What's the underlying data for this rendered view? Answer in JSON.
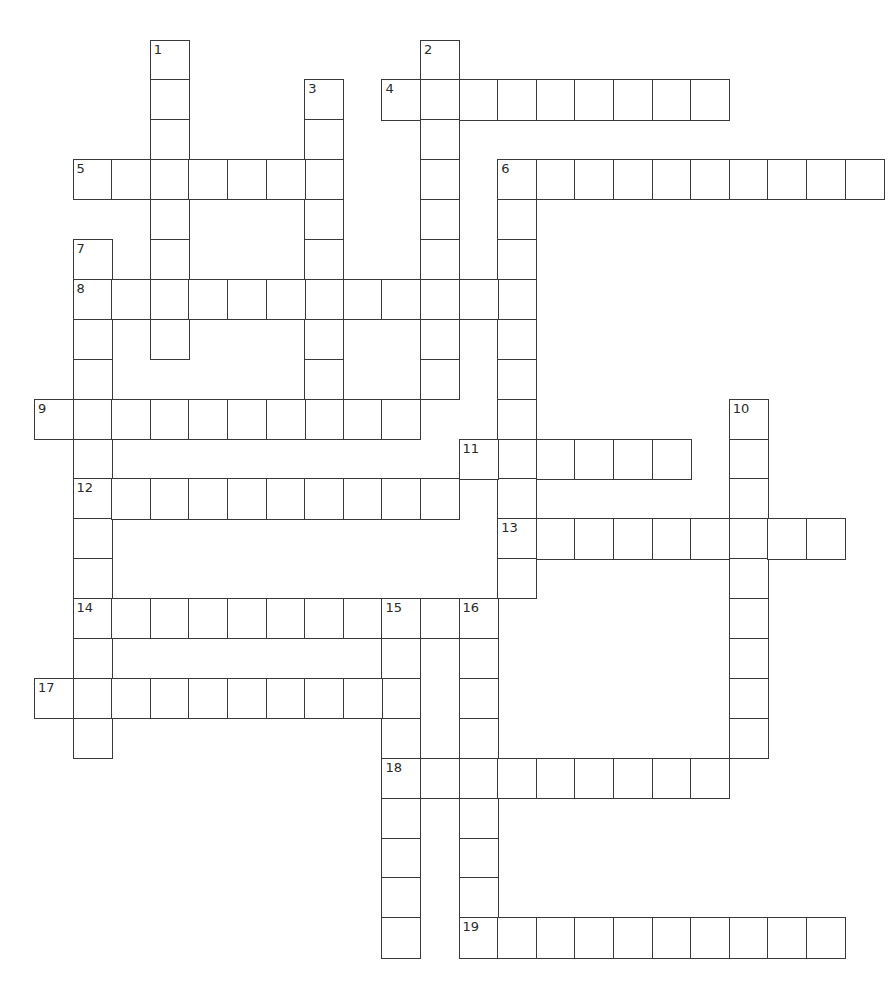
{
  "puzzle": {
    "title": "Crossword",
    "grid": {
      "cols": 22,
      "rows": 23,
      "origin_x": 34,
      "origin_y": 39.5,
      "cell_w": 38.6,
      "cell_h": 39.9,
      "border_color": "#3a3a3a",
      "background": "#ffffff"
    },
    "entries": [
      {
        "number": "1",
        "direction": "down",
        "row": 0,
        "col": 3,
        "length": 8
      },
      {
        "number": "2",
        "direction": "down",
        "row": 0,
        "col": 10,
        "length": 9
      },
      {
        "number": "3",
        "direction": "down",
        "row": 1,
        "col": 7,
        "length": 9
      },
      {
        "number": "4",
        "direction": "across",
        "row": 1,
        "col": 9,
        "length": 9
      },
      {
        "number": "5",
        "direction": "across",
        "row": 3,
        "col": 1,
        "length": 7
      },
      {
        "number": "6",
        "direction": "across",
        "row": 3,
        "col": 12,
        "length": 10
      },
      {
        "number": "6",
        "direction": "down",
        "row": 3,
        "col": 12,
        "length": 11
      },
      {
        "number": "7",
        "direction": "down",
        "row": 5,
        "col": 1,
        "length": 13
      },
      {
        "number": "8",
        "direction": "across",
        "row": 6,
        "col": 1,
        "length": 12
      },
      {
        "number": "9",
        "direction": "across",
        "row": 9,
        "col": 0,
        "length": 10
      },
      {
        "number": "10",
        "direction": "down",
        "row": 9,
        "col": 18,
        "length": 9
      },
      {
        "number": "11",
        "direction": "across",
        "row": 10,
        "col": 11,
        "length": 6
      },
      {
        "number": "12",
        "direction": "across",
        "row": 11,
        "col": 1,
        "length": 10
      },
      {
        "number": "13",
        "direction": "across",
        "row": 12,
        "col": 12,
        "length": 9
      },
      {
        "number": "14",
        "direction": "across",
        "row": 14,
        "col": 1,
        "length": 11
      },
      {
        "number": "15",
        "direction": "down",
        "row": 14,
        "col": 9,
        "length": 9
      },
      {
        "number": "16",
        "direction": "down",
        "row": 14,
        "col": 11,
        "length": 9
      },
      {
        "number": "17",
        "direction": "across",
        "row": 16,
        "col": 0,
        "length": 10
      },
      {
        "number": "18",
        "direction": "across",
        "row": 18,
        "col": 9,
        "length": 9
      },
      {
        "number": "19",
        "direction": "across",
        "row": 22,
        "col": 11,
        "length": 10
      }
    ]
  }
}
